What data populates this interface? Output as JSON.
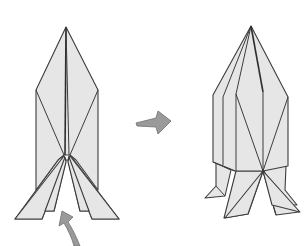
{
  "diagram": {
    "description": "Origami folding step: rocket/figure base before and after shaping",
    "steps": [
      {
        "id": "before",
        "label": "Step before: flat rocket shape with four flaps spread at bottom"
      },
      {
        "id": "after",
        "label": "Step after: 3D rocket shape with legs formed"
      }
    ],
    "arrows": [
      {
        "id": "transition-arrow",
        "type": "process-arrow",
        "direction": "right",
        "color": "#9a9a9a"
      },
      {
        "id": "lift-arrow",
        "type": "curved-fold-arrow",
        "direction": "up",
        "color": "#9a9a9a"
      }
    ],
    "colors": {
      "paper": "#e6e6e6",
      "outline": "#3c3c3c",
      "arrow": "#9a9a9a"
    }
  }
}
